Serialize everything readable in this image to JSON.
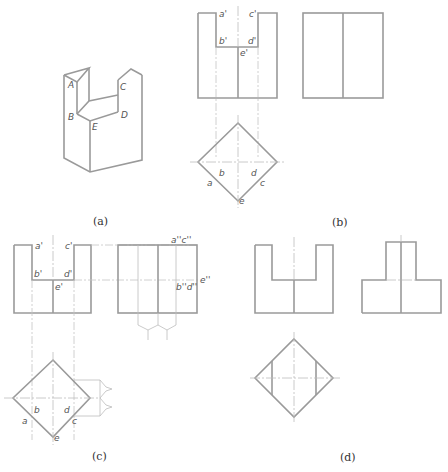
{
  "figure": {
    "colors": {
      "outline": "#9a9a9a",
      "thin": "#bdbdbd",
      "text": "#555555"
    },
    "captions": {
      "a": "(a)",
      "b": "(b)",
      "c": "(c)",
      "d": "(d)"
    },
    "panel_a": {
      "description": "Isometric view of a square prism with a U-shaped notch",
      "points": {
        "A": "A",
        "B": "B",
        "C": "C",
        "D": "D",
        "E": "E"
      }
    },
    "panel_b": {
      "front_view_labels": {
        "a1": "a'",
        "c1": "c'",
        "b1": "b'",
        "d1": "d'",
        "e1": "e'"
      },
      "top_view_labels": {
        "a": "a",
        "b": "b",
        "c": "c",
        "d": "d",
        "e": "e"
      }
    },
    "panel_c": {
      "front_view_labels": {
        "a1": "a'",
        "c1": "c'",
        "b1": "b'",
        "d1": "d'",
        "e1": "e'"
      },
      "side_view_labels": {
        "ac2": "a''c''",
        "bd2": "b''d''",
        "e2": "e''"
      },
      "top_view_labels": {
        "a": "a",
        "b": "b",
        "c": "c",
        "d": "d",
        "e": "e"
      }
    },
    "panel_d": {
      "description": "Completed three-view drawing"
    }
  }
}
